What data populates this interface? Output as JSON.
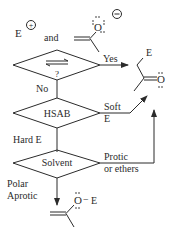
{
  "reactants": {
    "electrophile": "E",
    "electrophile_charge": "+",
    "conjunction": "and",
    "enolate_oxygen": "O",
    "enolate_charge": "−"
  },
  "decisions": [
    {
      "id": "equilibrium",
      "symbol": "⇌",
      "question": "?",
      "yes_label": "Yes",
      "no_label": "No"
    },
    {
      "id": "hsab",
      "label": "HSAB",
      "soft_label_line1": "Soft",
      "soft_label_line2": "E",
      "hard_label": "Hard E"
    },
    {
      "id": "solvent",
      "label": "Solvent",
      "protic_line1": "Protic",
      "protic_line2": "or ethers",
      "aprotic_line1": "Polar",
      "aprotic_line2": "Aprotic"
    }
  ],
  "products": {
    "c_alkylation": {
      "substituent": "E",
      "oxygen": "O"
    },
    "o_alkylation": {
      "oxygen": "O",
      "bond": "−",
      "substituent": "E"
    }
  },
  "colors": {
    "ink": "#2b2b2b",
    "background": "#ffffff"
  }
}
